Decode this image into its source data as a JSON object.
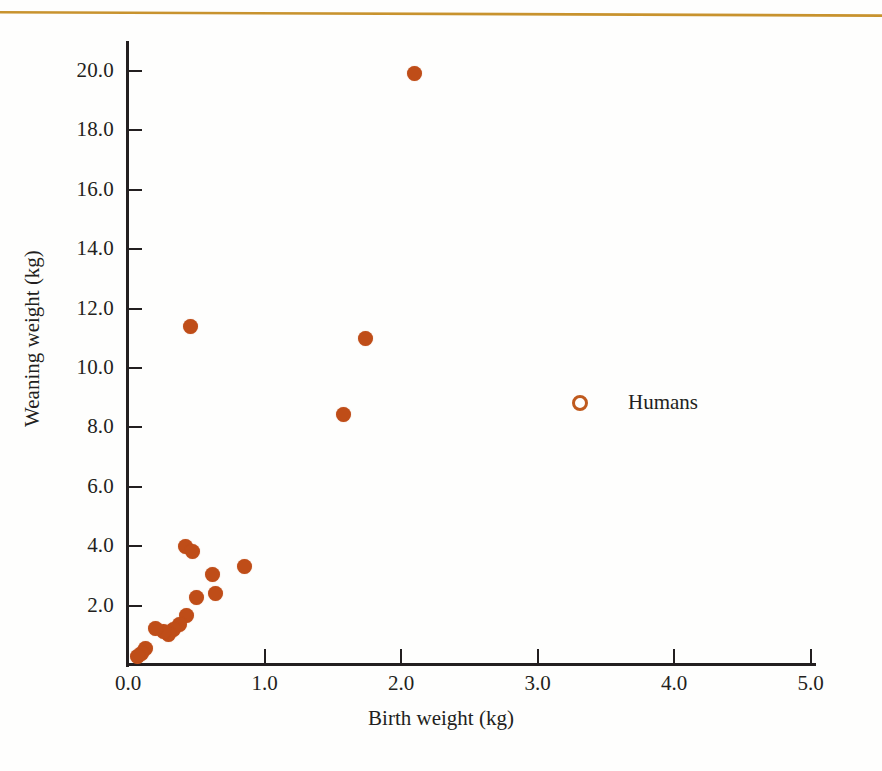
{
  "figure": {
    "background": "#fefefd",
    "rule_color": "#c8932e"
  },
  "chart_data": {
    "type": "scatter",
    "title": "",
    "xlabel": "Birth weight (kg)",
    "ylabel": "Weaning weight (kg)",
    "xlim": [
      0.0,
      5.4
    ],
    "ylim": [
      0.0,
      21.0
    ],
    "xticks": [
      "0.0",
      "1.0",
      "2.0",
      "3.0",
      "4.0",
      "5.0"
    ],
    "xtick_values": [
      0.0,
      1.0,
      2.0,
      3.0,
      4.0,
      5.0
    ],
    "yticks": [
      "2.0",
      "4.0",
      "6.0",
      "8.0",
      "10.0",
      "12.0",
      "14.0",
      "16.0",
      "18.0",
      "20.0"
    ],
    "ytick_values": [
      2.0,
      4.0,
      6.0,
      8.0,
      10.0,
      12.0,
      14.0,
      16.0,
      18.0,
      20.0
    ],
    "grid": false,
    "legend_position": "center-right",
    "marker_color": "#bf4d18",
    "series": [
      {
        "name": "Humans",
        "marker": "circle",
        "color": "#bf4d18",
        "points": [
          {
            "x": 2.1,
            "y": 19.9
          },
          {
            "x": 0.46,
            "y": 11.4
          },
          {
            "x": 1.74,
            "y": 11.0
          },
          {
            "x": 1.58,
            "y": 8.45
          },
          {
            "x": 0.42,
            "y": 4.0
          },
          {
            "x": 0.47,
            "y": 3.82
          },
          {
            "x": 0.85,
            "y": 3.3
          },
          {
            "x": 0.62,
            "y": 3.05
          },
          {
            "x": 0.64,
            "y": 2.4
          },
          {
            "x": 0.5,
            "y": 2.28
          },
          {
            "x": 0.43,
            "y": 1.68
          },
          {
            "x": 0.38,
            "y": 1.38
          },
          {
            "x": 0.33,
            "y": 1.18
          },
          {
            "x": 0.3,
            "y": 1.02
          },
          {
            "x": 0.26,
            "y": 1.12
          },
          {
            "x": 0.2,
            "y": 1.22
          },
          {
            "x": 0.13,
            "y": 0.55
          },
          {
            "x": 0.1,
            "y": 0.4
          },
          {
            "x": 0.07,
            "y": 0.3
          }
        ]
      }
    ]
  },
  "legend": {
    "entries": [
      {
        "label": "Humans",
        "marker": "open-circle",
        "color": "#bf5a1e"
      }
    ]
  }
}
